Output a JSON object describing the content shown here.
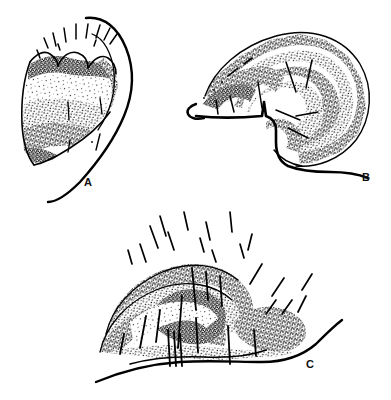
{
  "plate": {
    "title": "Stippled line drawings of three shell hinge structures",
    "background_color": "#ffffff",
    "ink_color": "#000000",
    "width": 391,
    "height": 400,
    "technique": "pen-and-ink stipple"
  },
  "figures": [
    {
      "id": "A",
      "label": "A",
      "caption": "Figure A",
      "description": "Left-pointing wedge-shaped shell with three rounded denticles along the upper margin, concentric stippled growth bands, and a long sweeping outer curve on the right.",
      "label_position": {
        "x": 84,
        "y": 177
      }
    },
    {
      "id": "B",
      "label": "B",
      "caption": "Figure B",
      "description": "Broad dome-shaped shell with nested concentric stippled bands radiating from a notched anterior hinge at the left, and a trailing basal line at lower right.",
      "label_position": {
        "x": 362,
        "y": 172
      }
    },
    {
      "id": "C",
      "label": "C",
      "caption": "Figure C",
      "description": "Low arched shell with overlapping stippled lobes, radiating bristle hairs above, vertical spines below, and a long basal line running to the lower right.",
      "label_position": {
        "x": 306,
        "y": 359
      }
    }
  ],
  "colors": {
    "ink": "#000000",
    "paper": "#ffffff",
    "label_text": "#111111"
  }
}
